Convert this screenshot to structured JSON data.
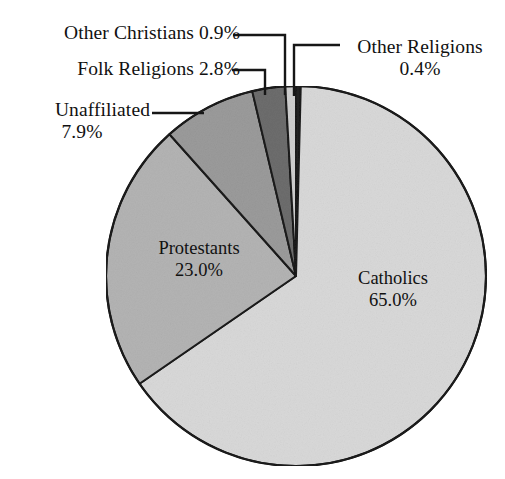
{
  "chart_data": {
    "type": "pie",
    "title": "",
    "categories": [
      "Catholics",
      "Protestants",
      "Unaffiliated",
      "Folk Religions",
      "Other Christians",
      "Other Religions"
    ],
    "values": [
      65.0,
      23.0,
      7.9,
      2.8,
      0.9,
      0.4
    ],
    "value_unit": "%",
    "legend_position": "none",
    "grid": false,
    "slices": [
      {
        "name": "Catholics",
        "label": "Catholics",
        "value_label": "65.0%",
        "value": 65.0,
        "color": "#d9d9d9",
        "label_placement": "inside"
      },
      {
        "name": "Protestants",
        "label": "Protestants",
        "value_label": "23.0%",
        "value": 23.0,
        "color": "#b4b4b4",
        "label_placement": "inside"
      },
      {
        "name": "Unaffiliated",
        "label": "Unaffiliated",
        "value_label": "7.9%",
        "value": 7.9,
        "color": "#9b9b9b",
        "label_placement": "callout"
      },
      {
        "name": "Folk Religions",
        "label": "Folk Religions 2.8%",
        "value_label": "2.8%",
        "value": 2.8,
        "color": "#6d6d6d",
        "label_placement": "callout"
      },
      {
        "name": "Other Christians",
        "label": "Other Christians 0.9%",
        "value_label": "0.9%",
        "value": 0.9,
        "color": "#cfcfcf",
        "label_placement": "callout"
      },
      {
        "name": "Other Religions",
        "label": "Other Religions",
        "value_label": "0.4%",
        "value": 0.4,
        "color": "#242424",
        "label_placement": "callout"
      }
    ]
  },
  "labels": {
    "other_christians": "Other Christians 0.9%",
    "folk_religions": "Folk Religions 2.8%",
    "unaffiliated_name": "Unaffiliated",
    "unaffiliated_value": "7.9%",
    "other_religions_name": "Other Religions",
    "other_religions_value": "0.4%",
    "catholics_name": "Catholics",
    "catholics_value": "65.0%",
    "protestants_name": "Protestants",
    "protestants_value": "23.0%"
  },
  "colors": {
    "background": "#ffffff",
    "outline": "#1a1a1a",
    "text": "#111111",
    "catholics": "#d9d9d9",
    "protestants": "#b4b4b4",
    "unaffiliated": "#9b9b9b",
    "folk_religions": "#6d6d6d",
    "other_christians": "#cfcfcf",
    "other_religions": "#242424"
  }
}
